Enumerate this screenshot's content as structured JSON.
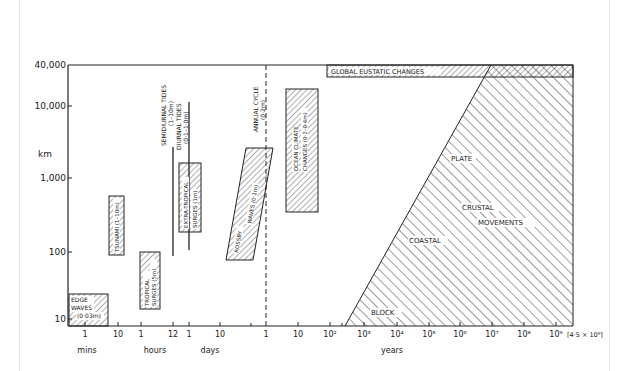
{
  "y_axis": {
    "unit_label": "km",
    "ticks": [
      {
        "label": "40,000",
        "y": 65
      },
      {
        "label": "10,000",
        "y": 106
      },
      {
        "label": "1,000",
        "y": 178
      },
      {
        "label": "100",
        "y": 252
      },
      {
        "label": "10",
        "y": 319
      }
    ]
  },
  "x_axis": {
    "ticks": [
      {
        "label": "1",
        "x": 85
      },
      {
        "label": "10",
        "x": 118
      },
      {
        "label": "1",
        "x": 141
      },
      {
        "label": "12",
        "x": 173
      },
      {
        "label": "1",
        "x": 189
      },
      {
        "label": "10",
        "x": 220
      },
      {
        "label": "1",
        "x": 266
      },
      {
        "label": "10",
        "x": 298
      },
      {
        "label": "10²",
        "x": 330
      },
      {
        "label": "10³",
        "x": 364
      },
      {
        "label": "10⁴",
        "x": 397
      },
      {
        "label": "10⁵",
        "x": 429
      },
      {
        "label": "10⁶",
        "x": 460
      },
      {
        "label": "10⁷",
        "x": 492
      },
      {
        "label": "10⁸",
        "x": 524
      },
      {
        "label": "10⁹",
        "x": 556
      }
    ],
    "end_label": "[4·5 × 10⁹]",
    "unit_labels": {
      "mins": "mins",
      "hours": "hours",
      "days": "days",
      "years": "years"
    }
  },
  "phenomena": {
    "edge_waves": {
      "line1": "EDGE",
      "line2": "WAVES",
      "line3": "(0·03m)"
    },
    "tsunami": {
      "line1": "TSUNAMI (1–10m)"
    },
    "tropical_surges": {
      "line1": "TROPICAL",
      "line2": "SURGES (5m)"
    },
    "semidiurnal_tides": {
      "line1": "SEMIDIURNAL TIDES",
      "line2": "(1–10m)"
    },
    "diurnal_tides": {
      "line1": "DIURNAL TIDES",
      "line2": "(0·1–1·0m)"
    },
    "extratropical_surges": {
      "line1": "EXTRA-TROPICAL",
      "line2": "SURGES (1m)"
    },
    "rossby_waves": {
      "line1": "ROSSBY",
      "line2": "WAVES (0·1m)"
    },
    "annual_cycle": {
      "line1": "ANNUAL CYCLE",
      "line2": "(0·2m)"
    },
    "ocean_climate": {
      "line1": "OCEAN CLIMATE",
      "line2": "CHANGES (0·2–0·4m)"
    },
    "global_eustatic": {
      "line1": "GLOBAL EUSTATIC CHANGES"
    },
    "crustal": {
      "plate": "PLATE",
      "crustal": "CRUSTAL",
      "movements": "MOVEMENTS",
      "coastal": "COASTAL",
      "block": "BLOCK"
    }
  }
}
